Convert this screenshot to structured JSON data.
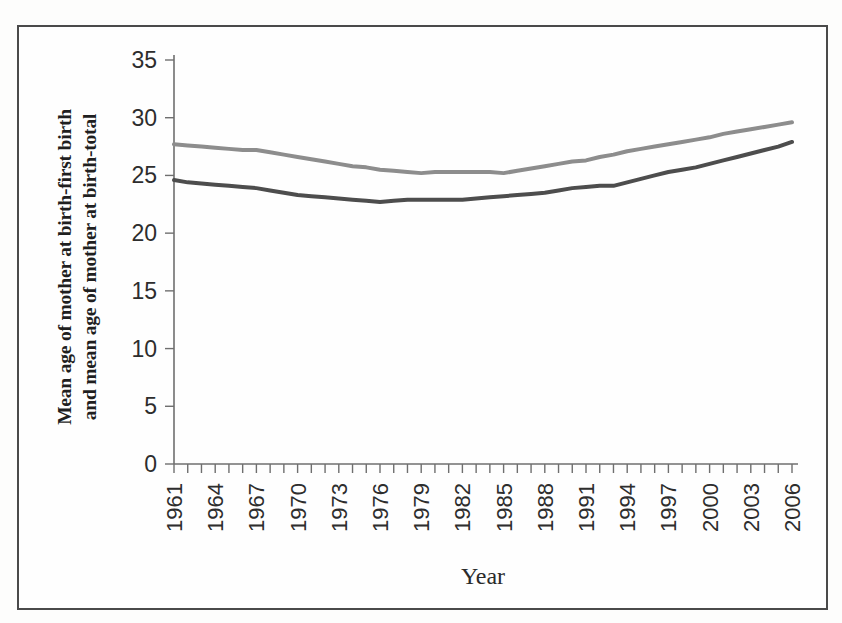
{
  "figure": {
    "background_color": "#fefefe",
    "frame_color": "#4a4a4a"
  },
  "chart_data": {
    "type": "line",
    "title": "",
    "xlabel": "Year",
    "ylabel": "Mean age of mother at birth-first birth and mean age of mother at birth-total",
    "ylabel_line1": "Mean age of mother at birth-first birth",
    "ylabel_line2": "and mean age of mother at birth-total",
    "ylim": [
      0,
      35
    ],
    "ytick_labels": [
      "0",
      "5",
      "10",
      "15",
      "20",
      "25",
      "30",
      "35"
    ],
    "yticks": [
      0,
      5,
      10,
      15,
      20,
      25,
      30,
      35
    ],
    "xlim": [
      1961,
      2006
    ],
    "xtick_labels": [
      "1961",
      "1964",
      "1967",
      "1970",
      "1973",
      "1976",
      "1979",
      "1982",
      "1985",
      "1988",
      "1991",
      "1994",
      "1997",
      "2000",
      "2003",
      "2006"
    ],
    "xticks": [
      1961,
      1964,
      1967,
      1970,
      1973,
      1976,
      1979,
      1982,
      1985,
      1988,
      1991,
      1994,
      1997,
      2000,
      2003,
      2006
    ],
    "x": [
      1961,
      1962,
      1963,
      1964,
      1965,
      1966,
      1967,
      1968,
      1969,
      1970,
      1971,
      1972,
      1973,
      1974,
      1975,
      1976,
      1977,
      1978,
      1979,
      1980,
      1981,
      1982,
      1983,
      1984,
      1985,
      1986,
      1987,
      1988,
      1989,
      1990,
      1991,
      1992,
      1993,
      1994,
      1995,
      1996,
      1997,
      1998,
      1999,
      2000,
      2001,
      2002,
      2003,
      2004,
      2005,
      2006
    ],
    "grid": false,
    "legend_position": "none",
    "series": [
      {
        "name": "Mean age of mother at birth-total",
        "color": "#8d8d8d",
        "line_width": 4,
        "values": [
          27.7,
          27.6,
          27.5,
          27.4,
          27.3,
          27.2,
          27.2,
          27.0,
          26.8,
          26.6,
          26.4,
          26.2,
          26.0,
          25.8,
          25.7,
          25.5,
          25.4,
          25.3,
          25.2,
          25.3,
          25.3,
          25.3,
          25.3,
          25.3,
          25.2,
          25.4,
          25.6,
          25.8,
          26.0,
          26.2,
          26.3,
          26.6,
          26.8,
          27.1,
          27.3,
          27.5,
          27.7,
          27.9,
          28.1,
          28.3,
          28.6,
          28.8,
          29.0,
          29.2,
          29.4,
          29.6
        ]
      },
      {
        "name": "Mean age of mother at birth-first birth",
        "color": "#4d4d4d",
        "line_width": 4,
        "values": [
          24.6,
          24.4,
          24.3,
          24.2,
          24.1,
          24.0,
          23.9,
          23.7,
          23.5,
          23.3,
          23.2,
          23.1,
          23.0,
          22.9,
          22.8,
          22.7,
          22.8,
          22.9,
          22.9,
          22.9,
          22.9,
          22.9,
          23.0,
          23.1,
          23.2,
          23.3,
          23.4,
          23.5,
          23.7,
          23.9,
          24.0,
          24.1,
          24.1,
          24.4,
          24.7,
          25.0,
          25.3,
          25.5,
          25.7,
          26.0,
          26.3,
          26.6,
          26.9,
          27.2,
          27.5,
          27.9
        ]
      }
    ]
  }
}
